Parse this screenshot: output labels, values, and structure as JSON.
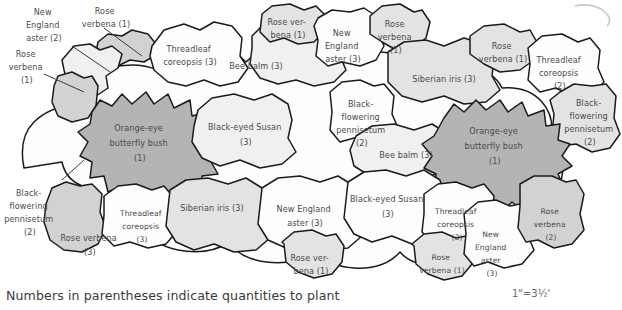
{
  "figure": {
    "kind": "garden-planting-plan",
    "caption": "Numbers in parentheses indicate quantities to plant",
    "scale": "1\"=3½'"
  },
  "palette": {
    "outline": "#1a1a1a",
    "text": "#4a4a4a",
    "fill_white": "#fdfdfd",
    "fill_pale": "#f0f0f0",
    "fill_light": "#e3e3e3",
    "fill_mid": "#d2d2d2",
    "fill_dark": "#b4b4b4",
    "background": "#ffffff"
  },
  "callouts": [
    {
      "id": "callout-new-england-aster",
      "lines": [
        "New",
        "England",
        "aster (2)"
      ]
    },
    {
      "id": "callout-rose-verbena-top",
      "lines": [
        "Rose",
        "verbena (1)"
      ]
    },
    {
      "id": "callout-rose-verbena-left",
      "lines": [
        "Rose",
        "verbena",
        "(1)"
      ]
    },
    {
      "id": "callout-black-flowering-pennisetum",
      "lines": [
        "Black-",
        "flowering",
        "pennisetum",
        "(2)"
      ]
    }
  ],
  "beds": [
    {
      "id": "bed-rose-verbena-upper-left",
      "plant": "Rose verbena",
      "qty": 1,
      "tone": "mid",
      "lines": []
    },
    {
      "id": "bed-new-england-aster-left",
      "plant": "New England aster",
      "qty": 2,
      "tone": "pale",
      "lines": []
    },
    {
      "id": "bed-rose-verbena-left-edge",
      "plant": "Rose verbena",
      "qty": 1,
      "tone": "mid",
      "lines": []
    },
    {
      "id": "bed-threadleaf-coreopsis-top",
      "plant": "Threadleaf coreopsis",
      "qty": 3,
      "tone": "white",
      "lines": [
        "Threadleaf",
        "coreopsis (3)"
      ]
    },
    {
      "id": "bed-bee-balm-top",
      "plant": "Bee balm",
      "qty": 3,
      "tone": "pale",
      "lines": [
        "Bee balm (3)"
      ]
    },
    {
      "id": "bed-rose-verbena-top-center",
      "plant": "Rose verbena",
      "qty": 1,
      "tone": "light",
      "lines": [
        "Rose ver-",
        "bena (1)"
      ]
    },
    {
      "id": "bed-new-england-aster-top-center",
      "plant": "New England aster",
      "qty": 3,
      "tone": "white",
      "lines": [
        "New",
        "England",
        "aster (3)"
      ]
    },
    {
      "id": "bed-rose-verbena-top-right-inner",
      "plant": "Rose verbena",
      "qty": 1,
      "tone": "light",
      "lines": [
        "Rose",
        "verbena",
        "(1)"
      ]
    },
    {
      "id": "bed-siberian-iris-top-right",
      "plant": "Siberian iris",
      "qty": 3,
      "tone": "light",
      "lines": [
        "Siberian iris (3)"
      ]
    },
    {
      "id": "bed-rose-verbena-top-right-outer",
      "plant": "Rose verbena",
      "qty": 1,
      "tone": "light",
      "lines": [
        "Rose",
        "verbena (1)"
      ]
    },
    {
      "id": "bed-threadleaf-coreopsis-top-right",
      "plant": "Threadleaf coreopsis",
      "qty": 2,
      "tone": "white",
      "lines": [
        "Threadleaf",
        "coreopsis",
        "(2)"
      ]
    },
    {
      "id": "bed-black-flowering-pennisetum-right",
      "plant": "Black-flowering pennisetum",
      "qty": 2,
      "tone": "light",
      "lines": [
        "Black-",
        "flowering",
        "pennisetum",
        "(2)"
      ]
    },
    {
      "id": "bed-orange-eye-butterfly-bush-left",
      "plant": "Orange-eye butterfly bush",
      "qty": 1,
      "tone": "dark",
      "lines": [
        "Orange-eye",
        "butterfly bush",
        "(1)"
      ]
    },
    {
      "id": "bed-black-eyed-susan-upper",
      "plant": "Black-eyed Susan",
      "qty": 3,
      "tone": "pale",
      "lines": [
        "Black-eyed Susan",
        "(3)"
      ]
    },
    {
      "id": "bed-black-flowering-pennisetum-center",
      "plant": "Black-flowering pennisetum",
      "qty": 2,
      "tone": "white",
      "lines": [
        "Black-",
        "flowering",
        "pennisetum",
        "(2)"
      ]
    },
    {
      "id": "bed-bee-balm-center",
      "plant": "Bee balm",
      "qty": 3,
      "tone": "pale",
      "lines": [
        "Bee balm (3)"
      ]
    },
    {
      "id": "bed-orange-eye-butterfly-bush-right",
      "plant": "Orange-eye butterfly bush",
      "qty": 1,
      "tone": "dark",
      "lines": [
        "Orange-eye",
        "butterfly bush",
        "(1)"
      ]
    },
    {
      "id": "bed-rose-verbena-lower-left",
      "plant": "Rose verbena",
      "qty": 3,
      "tone": "mid",
      "lines": [
        "Rose verbena",
        "(3)"
      ]
    },
    {
      "id": "bed-threadleaf-coreopsis-lower-left",
      "plant": "Threadleaf coreopsis",
      "qty": 3,
      "tone": "white",
      "lines": [
        "Threadleaf",
        "coreopsis",
        "(3)"
      ]
    },
    {
      "id": "bed-siberian-iris-lower",
      "plant": "Siberian iris",
      "qty": 3,
      "tone": "light",
      "lines": [
        "Siberian iris (3)"
      ]
    },
    {
      "id": "bed-new-england-aster-lower-center",
      "plant": "New England aster",
      "qty": 3,
      "tone": "white",
      "lines": [
        "New England",
        "aster (3)"
      ]
    },
    {
      "id": "bed-rose-verbena-bottom-center",
      "plant": "Rose verbena",
      "qty": 1,
      "tone": "light",
      "lines": [
        "Rose ver-",
        "bena (1)"
      ]
    },
    {
      "id": "bed-black-eyed-susan-lower",
      "plant": "Black-eyed Susan",
      "qty": 3,
      "tone": "white",
      "lines": [
        "Black-eyed Susan",
        "(3)"
      ]
    },
    {
      "id": "bed-threadleaf-coreopsis-bottom-right",
      "plant": "Threadleaf coreopsis",
      "qty": 3,
      "tone": "white",
      "lines": [
        "Threadleaf",
        "coreopsis",
        "(3)"
      ]
    },
    {
      "id": "bed-rose-verbena-bottom-right",
      "plant": "Rose verbena",
      "qty": 1,
      "tone": "light",
      "lines": [
        "Rose",
        "verbena (1)"
      ]
    },
    {
      "id": "bed-new-england-aster-bottom-right",
      "plant": "New England aster",
      "qty": 3,
      "tone": "white",
      "lines": [
        "New",
        "England",
        "aster",
        "(3)"
      ]
    },
    {
      "id": "bed-rose-verbena-right-edge",
      "plant": "Rose verbena",
      "qty": 2,
      "tone": "mid",
      "lines": [
        "Rose",
        "verbena",
        "(2)"
      ]
    }
  ]
}
